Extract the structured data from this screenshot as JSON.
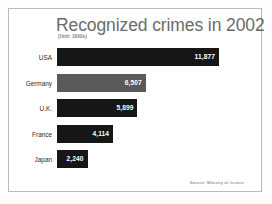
{
  "slide": {
    "background_color": "#ffffff",
    "frame_color": "#b9b9b9"
  },
  "title": "Recognized crimes in 2002",
  "subtitle": "(Unit: 1000s)",
  "source_note": "Source: Ministry of Justice",
  "chart_data": {
    "type": "bar",
    "orientation": "horizontal",
    "title": "Recognized crimes in 2002",
    "subtitle": "(Unit: 1000s)",
    "xlabel": "",
    "ylabel": "",
    "unit": "1000s",
    "grid": false,
    "legend": "none",
    "xlim": [
      0,
      11877
    ],
    "categories": [
      "USA",
      "Germany",
      "U.K.",
      "France",
      "Japan"
    ],
    "values": [
      11877,
      6507,
      5899,
      4114,
      2240
    ],
    "value_labels": [
      "11,877",
      "6,507",
      "5,899",
      "4,114",
      "2,240"
    ],
    "bar_colors": [
      "#161616",
      "#5a5a5a",
      "#161616",
      "#161616",
      "#161616"
    ],
    "bars": [
      {
        "label": "USA",
        "value": 11877,
        "value_label": "11,877",
        "color": "#161616",
        "style": "dark"
      },
      {
        "label": "Germany",
        "value": 6507,
        "value_label": "6,507",
        "color": "#5a5a5a",
        "style": "light"
      },
      {
        "label": "U.K.",
        "value": 5899,
        "value_label": "5,899",
        "color": "#161616",
        "style": "dark"
      },
      {
        "label": "France",
        "value": 4114,
        "value_label": "4,114",
        "color": "#161616",
        "style": "dark"
      },
      {
        "label": "Japan",
        "value": 2240,
        "value_label": "2,240",
        "color": "#161616",
        "style": "dark"
      }
    ],
    "annotations": [
      "Source: Ministry of Justice"
    ]
  }
}
